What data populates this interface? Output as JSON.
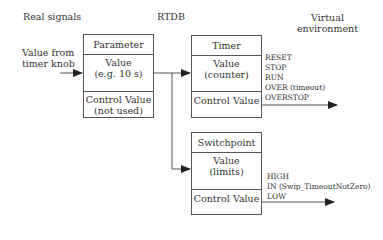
{
  "headers": {
    "real_signals": "Real signals",
    "rtdb": "RTDB",
    "virtual_line1": "Virtual",
    "virtual_line2": "environment"
  },
  "input_label": {
    "line1": "Value from",
    "line2": "timer knob"
  },
  "parameter_box": {
    "title": "Parameter",
    "value_line1": "Value",
    "value_line2": "(e.g. 10 s)",
    "control_line1": "Control Value",
    "control_line2": "(not used)"
  },
  "timer_box": {
    "title": "Timer",
    "value_line1": "Value",
    "value_line2": "(counter)",
    "control": "Control Value",
    "states": [
      "RESET",
      "STOP",
      "RUN",
      "OVER (timeout)",
      "OVERSTOP"
    ]
  },
  "switchpoint_box": {
    "title": "Switchpoint",
    "value_line1": "Value",
    "value_line2": "(limits)",
    "control": "Control Value",
    "states": [
      "HIGH",
      "IN (Swip_TimeoutNotZero)",
      "LOW"
    ]
  }
}
